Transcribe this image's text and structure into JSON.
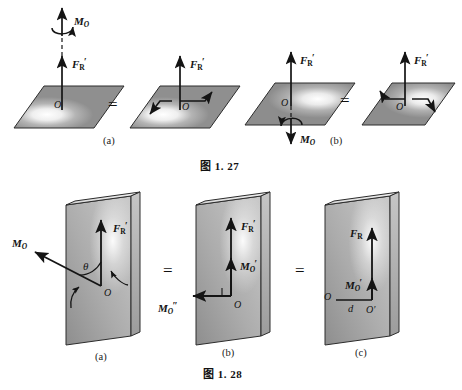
{
  "document": {
    "kind": "textbook-figure-page",
    "background_color": "#ffffff",
    "ink_color": "#141414"
  },
  "figures": [
    {
      "id": "fig-1-27",
      "caption": "图 1. 27",
      "panels": [
        {
          "key": "a",
          "label": "(a)",
          "equals_sign": "=",
          "left": {
            "surface": "parallelogram-plane",
            "origin_label": "O",
            "force_label": {
              "symbol": "F",
              "sub": "R",
              "prime": "′"
            },
            "moment_label": {
              "symbol": "M",
              "sub": "O"
            },
            "moment_direction": "up",
            "moment_style": "curved-arrow-counterclockwise"
          },
          "right": {
            "surface": "parallelogram-plane",
            "origin_label": "O",
            "force_label": {
              "symbol": "F",
              "sub": "R",
              "prime": "′"
            },
            "couple_style": "in-plane-couple-arrows"
          }
        },
        {
          "key": "b",
          "label": "(b)",
          "equals_sign": "=",
          "left": {
            "surface": "parallelogram-plane",
            "origin_label": "O",
            "force_label": {
              "symbol": "F",
              "sub": "R",
              "prime": "′"
            },
            "moment_label": {
              "symbol": "M",
              "sub": "O"
            },
            "moment_direction": "down",
            "moment_style": "curved-arrow-clockwise"
          },
          "right": {
            "surface": "parallelogram-plane",
            "origin_label": "O",
            "force_label": {
              "symbol": "F",
              "sub": "R",
              "prime": "′"
            },
            "couple_style": "in-plane-couple-arrows"
          }
        }
      ]
    },
    {
      "id": "fig-1-28",
      "caption": "图 1. 28",
      "panels": [
        {
          "key": "a",
          "label": "(a)",
          "equals_sign": "=",
          "surface": "rectangular-slab-3d",
          "origin_label": "O",
          "force_label": {
            "symbol": "F",
            "sub": "R",
            "prime": "′"
          },
          "moment_label": {
            "symbol": "M",
            "sub": "O"
          },
          "angle_label": "θ",
          "moment_direction": "upper-left-oblique"
        },
        {
          "key": "b",
          "label": "(b)",
          "equals_sign": "=",
          "surface": "rectangular-slab-3d",
          "origin_label": "O",
          "force_label": {
            "symbol": "F",
            "sub": "R",
            "prime": "′"
          },
          "moment_in_plane_label": {
            "symbol": "M",
            "sub": "O",
            "prime": "′"
          },
          "moment_out_plane_label": {
            "symbol": "M",
            "sub": "O",
            "prime": "″"
          },
          "right_angle_mark": true
        },
        {
          "key": "c",
          "label": "(c)",
          "surface": "rectangular-slab-3d",
          "origin_label": "O",
          "offset_point_label": "O′",
          "distance_label": "d",
          "force_label": {
            "symbol": "F",
            "sub": "R",
            "prime": ""
          },
          "moment_label": {
            "symbol": "M",
            "sub": "O",
            "prime": "′"
          }
        }
      ]
    }
  ],
  "labels": {
    "fig27": {
      "caption": "图 1. 27",
      "panel_a": "(a)",
      "panel_b": "(b)",
      "eq1": "=",
      "eq2": "=",
      "a_left_O": "O",
      "a_right_O": "O",
      "b_left_O": "O",
      "b_right_O": "O",
      "F_sym": "F",
      "F_sub": "R",
      "F_prime": "′",
      "M_sym": "M",
      "M_sub": "O"
    },
    "fig28": {
      "caption": "图 1. 28",
      "panel_a": "(a)",
      "panel_b": "(b)",
      "panel_c": "(c)",
      "eq1": "=",
      "eq2": "=",
      "F_sym": "F",
      "F_sub": "R",
      "F_prime": "′",
      "M_sym": "M",
      "M_sub": "O",
      "M_prime": "′",
      "M_dprime": "″",
      "theta": "θ",
      "O": "O",
      "O_prime": "O′",
      "d": "d"
    }
  }
}
